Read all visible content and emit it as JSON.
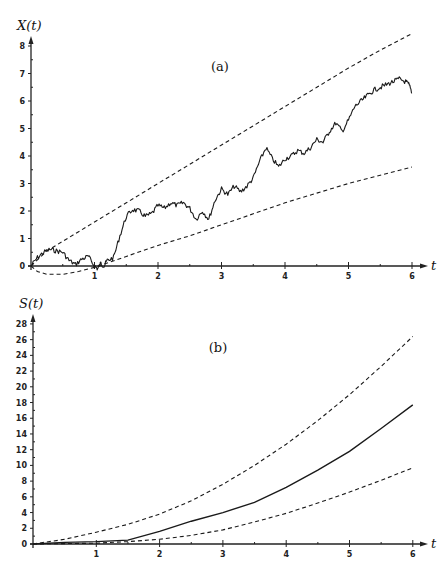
{
  "chart_data": [
    {
      "panel": "a",
      "type": "line",
      "panel_label": "(a)",
      "ylabel": "X(t)",
      "xlabel": "t",
      "xlim": [
        0,
        6
      ],
      "ylim": [
        0,
        8
      ],
      "x_ticks": [
        1,
        2,
        3,
        4,
        5,
        6
      ],
      "y_ticks": [
        0,
        1,
        2,
        3,
        4,
        5,
        6,
        7,
        8
      ],
      "grid": false,
      "legend": null,
      "frame": {
        "x0": 31,
        "y0": 266,
        "px_per_x": 63.5,
        "px_per_y": 27.5,
        "arrow_x_end": 428,
        "arrow_y_end": 36
      },
      "series": [
        {
          "name": "sample path X(t)",
          "style": "solid-jagged",
          "x": [
            0,
            0.1,
            0.2,
            0.3,
            0.4,
            0.5,
            0.6,
            0.7,
            0.8,
            0.9,
            1.0,
            1.05,
            1.1,
            1.15,
            1.2,
            1.3,
            1.4,
            1.5,
            1.6,
            1.7,
            1.8,
            1.9,
            2.0,
            2.1,
            2.2,
            2.3,
            2.4,
            2.5,
            2.6,
            2.7,
            2.8,
            2.9,
            3.0,
            3.1,
            3.2,
            3.3,
            3.4,
            3.5,
            3.6,
            3.7,
            3.8,
            3.9,
            4.0,
            4.1,
            4.2,
            4.3,
            4.4,
            4.5,
            4.6,
            4.7,
            4.8,
            4.9,
            5.0,
            5.1,
            5.2,
            5.3,
            5.4,
            5.5,
            5.6,
            5.7,
            5.8,
            5.9,
            5.95,
            6.0
          ],
          "values": [
            0.0,
            0.3,
            0.5,
            0.6,
            0.55,
            0.5,
            0.2,
            0.05,
            0.25,
            0.35,
            0.0,
            -0.1,
            0.1,
            0.0,
            0.2,
            0.3,
            1.1,
            1.8,
            2.05,
            2.0,
            1.8,
            1.9,
            2.2,
            2.1,
            2.3,
            2.2,
            2.3,
            2.1,
            1.7,
            2.0,
            1.7,
            2.4,
            2.8,
            2.6,
            2.9,
            2.7,
            2.9,
            3.2,
            3.8,
            4.3,
            3.9,
            3.6,
            3.9,
            4.0,
            4.2,
            4.1,
            4.3,
            4.6,
            4.5,
            4.9,
            5.2,
            4.9,
            5.3,
            5.8,
            6.0,
            6.2,
            6.4,
            6.5,
            6.6,
            6.7,
            6.8,
            6.7,
            6.6,
            6.3
          ]
        },
        {
          "name": "upper envelope",
          "style": "dashed",
          "x": [
            0,
            0.25,
            0.5,
            1,
            1.5,
            2,
            2.5,
            3,
            3.5,
            4,
            4.5,
            5,
            5.5,
            6
          ],
          "values": [
            0,
            0.55,
            0.9,
            1.6,
            2.3,
            3.0,
            3.7,
            4.4,
            5.1,
            5.8,
            6.5,
            7.2,
            7.85,
            8.45
          ]
        },
        {
          "name": "lower envelope",
          "style": "dashed",
          "x": [
            0,
            0.1,
            0.25,
            0.5,
            0.75,
            1,
            1.25,
            1.5,
            2,
            2.5,
            3,
            3.5,
            4,
            4.5,
            5,
            5.5,
            6
          ],
          "values": [
            0,
            -0.2,
            -0.3,
            -0.3,
            -0.2,
            -0.05,
            0.15,
            0.35,
            0.75,
            1.1,
            1.5,
            1.9,
            2.3,
            2.65,
            3.0,
            3.3,
            3.6
          ]
        }
      ]
    },
    {
      "panel": "b",
      "type": "line",
      "panel_label": "(b)",
      "ylabel": "S(t)",
      "xlabel": "t",
      "xlim": [
        0,
        6
      ],
      "ylim": [
        0,
        28
      ],
      "x_ticks": [
        1,
        2,
        3,
        4,
        5,
        6
      ],
      "y_ticks": [
        0,
        2,
        4,
        6,
        8,
        10,
        12,
        14,
        16,
        18,
        20,
        22,
        24,
        26,
        28
      ],
      "grid": false,
      "legend": null,
      "frame": {
        "x0": 33,
        "y0": 544,
        "px_per_x": 63.3,
        "px_per_y": 7.86,
        "arrow_x_end": 428,
        "arrow_y_end": 314
      },
      "series": [
        {
          "name": "S(t)",
          "style": "solid",
          "x": [
            0,
            0.5,
            1.0,
            1.5,
            2.0,
            2.5,
            3.0,
            3.5,
            4.0,
            4.5,
            5.0,
            5.5,
            6.0
          ],
          "values": [
            0,
            0.2,
            0.3,
            0.5,
            1.6,
            2.9,
            4.0,
            5.3,
            7.2,
            9.4,
            11.8,
            14.7,
            17.7
          ]
        },
        {
          "name": "upper envelope",
          "style": "dashed",
          "x": [
            0,
            0.5,
            1.0,
            1.5,
            2.0,
            2.5,
            3.0,
            3.5,
            4.0,
            4.5,
            5.0,
            5.5,
            6.0
          ],
          "values": [
            0,
            0.6,
            1.5,
            2.5,
            3.8,
            5.5,
            7.6,
            10.0,
            12.7,
            15.7,
            19.0,
            22.6,
            26.4
          ]
        },
        {
          "name": "lower envelope",
          "style": "dashed",
          "x": [
            0,
            0.5,
            1.0,
            1.5,
            2.0,
            2.5,
            3.0,
            3.5,
            4.0,
            4.5,
            5.0,
            5.5,
            6.0
          ],
          "values": [
            0,
            0.05,
            0.1,
            0.3,
            0.6,
            1.1,
            1.8,
            2.8,
            3.9,
            5.2,
            6.6,
            8.1,
            9.7
          ]
        }
      ]
    }
  ]
}
